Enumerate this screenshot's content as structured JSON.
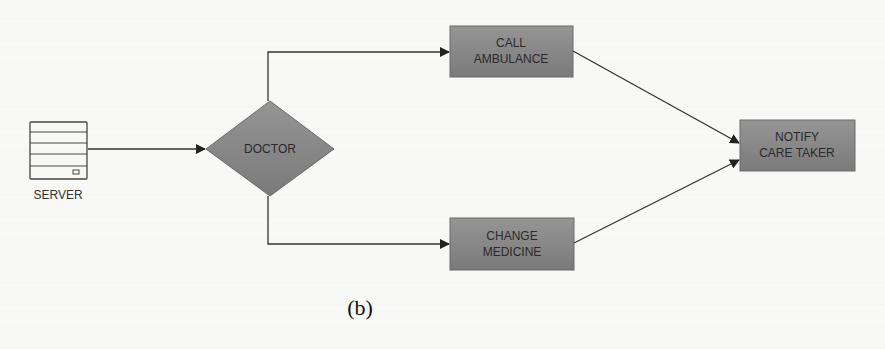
{
  "figure": {
    "caption": "(b)"
  },
  "nodes": {
    "server": {
      "label": "SERVER",
      "icon": "server-icon"
    },
    "doctor": {
      "label": "DOCTOR",
      "shape": "diamond"
    },
    "call_ambulance": {
      "line1": "CALL",
      "line2": "AMBULANCE"
    },
    "change_medicine": {
      "line1": "CHANGE",
      "line2": "MEDICINE"
    },
    "notify_care_taker": {
      "line1": "NOTIFY",
      "line2": "CARE TAKER"
    }
  },
  "edges": [
    {
      "from": "server",
      "to": "doctor"
    },
    {
      "from": "doctor",
      "to": "call_ambulance"
    },
    {
      "from": "doctor",
      "to": "change_medicine"
    },
    {
      "from": "call_ambulance",
      "to": "notify_care_taker"
    },
    {
      "from": "change_medicine",
      "to": "notify_care_taker"
    }
  ],
  "colors": {
    "node_fill": "#8a8a8a",
    "node_stroke": "#6a6a6a",
    "edge": "#333333",
    "text": "#2a2a2a"
  }
}
